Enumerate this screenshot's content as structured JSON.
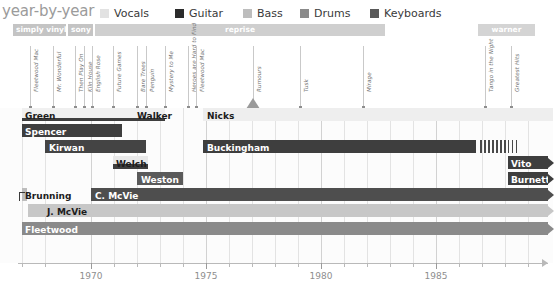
{
  "header": {
    "title": "year-by-year",
    "legend": [
      {
        "label": "Vocals",
        "color": "#e2e2e2",
        "x": 0
      },
      {
        "label": "Guitar",
        "color": "#2b2b2b",
        "x": 75
      },
      {
        "label": "Bass",
        "color": "#bdbdbd",
        "x": 143
      },
      {
        "label": "Drums",
        "color": "#8a8a8a",
        "x": 200
      },
      {
        "label": "Keyboards",
        "color": "#595959",
        "x": 270
      }
    ]
  },
  "labels": {
    "bars": [
      {
        "name": "simply vinyl",
        "x": 13,
        "w": 53,
        "color": "#c4c4c4",
        "align": "left"
      },
      {
        "name": "sony",
        "x": 68,
        "w": 25,
        "color": "#c4c4c4",
        "align": "left"
      },
      {
        "name": "reprise",
        "x": 95,
        "w": 290,
        "color": "#cfcfcf",
        "align": "center"
      },
      {
        "name": "warner",
        "x": 478,
        "w": 57,
        "color": "#d4d4d4",
        "align": "center"
      }
    ]
  },
  "albums": [
    {
      "title": "Fleetwood Mac",
      "x": 30,
      "h": 62,
      "big": false
    },
    {
      "title": "Mr. Wonderful",
      "x": 53,
      "h": 62,
      "big": false
    },
    {
      "title": "Then Play On",
      "x": 75,
      "h": 62,
      "big": false
    },
    {
      "title": "Kiln House",
      "x": 84,
      "h": 62,
      "big": false
    },
    {
      "title": "English Rose",
      "x": 92,
      "h": 62,
      "big": false
    },
    {
      "title": "Future Games",
      "x": 113,
      "h": 62,
      "big": false
    },
    {
      "title": "Bare Trees",
      "x": 137,
      "h": 62,
      "big": false
    },
    {
      "title": "Penguin",
      "x": 146,
      "h": 62,
      "big": false
    },
    {
      "title": "Mystery to Me",
      "x": 165,
      "h": 62,
      "big": false
    },
    {
      "title": "Heroes are Hard to Find",
      "x": 188,
      "h": 62,
      "big": false
    },
    {
      "title": "Fleetwood Mac",
      "x": 196,
      "h": 62,
      "big": false
    },
    {
      "title": "Rumours",
      "x": 253,
      "h": 62,
      "big": true
    },
    {
      "title": "Tusk",
      "x": 300,
      "h": 62,
      "big": false
    },
    {
      "title": "Mirage",
      "x": 363,
      "h": 62,
      "big": false
    },
    {
      "title": "Tango in the Night",
      "x": 485,
      "h": 62,
      "big": false
    },
    {
      "title": "Greatest Hits",
      "x": 511,
      "h": 62,
      "big": false
    }
  ],
  "members": [
    {
      "name": "Green",
      "x": 22,
      "w": 122,
      "y": 0,
      "h": 13,
      "color": "#f0f0f0",
      "text_color": "#1c1c1c",
      "label_x": 25,
      "label_y": 2,
      "sub": {
        "color": "#3e3e3e",
        "h": 3.5,
        "w": 122
      }
    },
    {
      "name": "Walker",
      "x": 134,
      "w": 31,
      "y": 0,
      "h": 13,
      "color": "#f0f0f0",
      "text_color": "#1c1c1c",
      "label_x": 137,
      "label_y": 2,
      "sub": {
        "color": "#3e3e3e",
        "h": 3.0,
        "w": 31
      }
    },
    {
      "name": "Nicks",
      "x": 203,
      "w": 350,
      "y": 0,
      "h": 13,
      "color": "#eeeeee",
      "text_color": "#1c1c1c",
      "label_x": 207,
      "label_y": 2,
      "sub": null
    },
    {
      "name": "Spencer",
      "x": 22,
      "w": 100,
      "y": 16,
      "h": 13,
      "color": "#3e3e3e",
      "text_color": "#ffffff",
      "label_x": 25,
      "label_y": 18,
      "sub": null
    },
    {
      "name": "Kirwan",
      "x": 45,
      "w": 101,
      "y": 32,
      "h": 13,
      "color": "#444444",
      "text_color": "#ffffff",
      "label_x": 49,
      "label_y": 34,
      "sub": null
    },
    {
      "name": "Buckingham",
      "x": 203,
      "w": 273,
      "y": 32,
      "h": 13,
      "color": "#3e3e3e",
      "text_color": "#ffffff",
      "label_x": 207,
      "label_y": 34,
      "sub": null
    },
    {
      "name": "Welch",
      "x": 113,
      "w": 35,
      "y": 48,
      "h": 13,
      "color": "#e8e8e8",
      "text_color": "#1c1c1c",
      "label_x": 116,
      "label_y": 50,
      "sub": {
        "color": "#3e3e3e",
        "h": 5,
        "w": 35
      }
    },
    {
      "name": "Vito",
      "x": 508,
      "w": 40,
      "y": 48,
      "h": 13,
      "color": "#3e3e3e",
      "text_color": "#ffffff",
      "label_x": 511,
      "label_y": 50,
      "sub": null
    },
    {
      "name": "Weston",
      "x": 137,
      "w": 46,
      "y": 64,
      "h": 13,
      "color": "#5a5a5a",
      "text_color": "#ffffff",
      "label_x": 141,
      "label_y": 66,
      "sub": null
    },
    {
      "name": "Burnette",
      "x": 508,
      "w": 40,
      "y": 64,
      "h": 13,
      "color": "#3e3e3e",
      "text_color": "#ffffff",
      "label_x": 511,
      "label_y": 66,
      "sub": null
    },
    {
      "name": "Brunning",
      "x": 22,
      "w": 5,
      "y": 80,
      "h": 13,
      "color": "#bdbdbd",
      "text_color": "#1c1c1c",
      "label_x": 25,
      "label_y": 82,
      "sub": null
    },
    {
      "name": "C. McVie",
      "x": 91,
      "w": 457,
      "y": 80,
      "h": 13,
      "color": "#4e4e4e",
      "text_color": "#ffffff",
      "label_x": 95,
      "label_y": 82,
      "sub": null
    },
    {
      "name": "J. McVie",
      "x": 28,
      "w": 520,
      "y": 96,
      "h": 13,
      "color": "#c7c7c7",
      "text_color": "#1c1c1c",
      "label_x": 47,
      "label_y": 98,
      "sub": null
    },
    {
      "name": "Fleetwood",
      "x": 22,
      "w": 526,
      "y": 114,
      "h": 13,
      "color": "#8a8a8a",
      "text_color": "#ffffff",
      "label_x": 25,
      "label_y": 116,
      "sub": null
    }
  ],
  "axis": {
    "ticks": [
      {
        "label": "",
        "x": 22
      },
      {
        "label": "",
        "x": 45
      },
      {
        "label": "1970",
        "x": 91
      },
      {
        "label": "",
        "x": 114
      },
      {
        "label": "",
        "x": 137
      },
      {
        "label": "",
        "x": 160
      },
      {
        "label": "",
        "x": 183
      },
      {
        "label": "1975",
        "x": 206
      },
      {
        "label": "",
        "x": 229
      },
      {
        "label": "",
        "x": 252
      },
      {
        "label": "",
        "x": 275
      },
      {
        "label": "",
        "x": 298
      },
      {
        "label": "1980",
        "x": 321
      },
      {
        "label": "",
        "x": 344
      },
      {
        "label": "",
        "x": 367
      },
      {
        "label": "",
        "x": 390
      },
      {
        "label": "",
        "x": 413
      },
      {
        "label": "1985",
        "x": 436
      },
      {
        "label": "",
        "x": 459
      },
      {
        "label": "",
        "x": 482
      },
      {
        "label": "",
        "x": 505
      },
      {
        "label": "",
        "x": 528
      }
    ],
    "majors": [
      91,
      206,
      321,
      436
    ]
  },
  "chart_data": {
    "type": "bar",
    "title": "year-by-year",
    "xlabel": "",
    "ylabel": "",
    "xlim": [
      1967,
      1990
    ],
    "grid": true,
    "legend_position": "top",
    "categories": [
      "Green",
      "Walker",
      "Nicks",
      "Spencer",
      "Kirwan",
      "Buckingham",
      "Welch",
      "Vito",
      "Weston",
      "Burnette",
      "Brunning",
      "C. McVie",
      "J. McVie",
      "Fleetwood"
    ],
    "series": [
      {
        "name": "Green",
        "role": "Guitar",
        "start": 1967,
        "end": 1970
      },
      {
        "name": "Walker",
        "role": "Guitar",
        "start": 1972,
        "end": 1973
      },
      {
        "name": "Nicks",
        "role": "Vocals",
        "start": 1975,
        "end": 1990
      },
      {
        "name": "Spencer",
        "role": "Guitar",
        "start": 1967,
        "end": 1971
      },
      {
        "name": "Kirwan",
        "role": "Guitar",
        "start": 1968,
        "end": 1972
      },
      {
        "name": "Buckingham",
        "role": "Guitar",
        "start": 1975,
        "end": 1987
      },
      {
        "name": "Welch",
        "role": "Guitar",
        "start": 1971,
        "end": 1974
      },
      {
        "name": "Vito",
        "role": "Guitar",
        "start": 1987,
        "end": 1990
      },
      {
        "name": "Weston",
        "role": "Guitar",
        "start": 1972,
        "end": 1973
      },
      {
        "name": "Burnette",
        "role": "Guitar",
        "start": 1987,
        "end": 1990
      },
      {
        "name": "Brunning",
        "role": "Bass",
        "start": 1967,
        "end": 1967
      },
      {
        "name": "C. McVie",
        "role": "Keyboards",
        "start": 1970,
        "end": 1990
      },
      {
        "name": "J. McVie",
        "role": "Bass",
        "start": 1967,
        "end": 1990
      },
      {
        "name": "Fleetwood",
        "role": "Drums",
        "start": 1967,
        "end": 1990
      }
    ],
    "axis_ticks": [
      "1970",
      "1975",
      "1980",
      "1985"
    ],
    "albums": [
      "Fleetwood Mac",
      "Mr. Wonderful",
      "Then Play On",
      "Kiln House",
      "English Rose",
      "Future Games",
      "Bare Trees",
      "Penguin",
      "Mystery to Me",
      "Heroes are Hard to Find",
      "Fleetwood Mac",
      "Rumours",
      "Tusk",
      "Mirage",
      "Tango in the Night",
      "Greatest Hits"
    ],
    "labels": [
      "simply vinyl",
      "sony",
      "reprise",
      "warner"
    ]
  }
}
